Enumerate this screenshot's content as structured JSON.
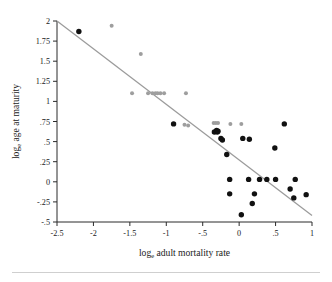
{
  "chart_data": {
    "type": "scatter",
    "title": "",
    "xlabel": "log_e adult mortality rate",
    "ylabel": "log_e age at maturity",
    "xlabel_main": "log",
    "xlabel_sub": "e",
    "xlabel_rest": " adult mortality rate",
    "ylabel_main": "log",
    "ylabel_sub": "e",
    "ylabel_rest": " age at maturity",
    "xlim": [
      -2.5,
      1.0
    ],
    "ylim": [
      -0.5,
      2.0
    ],
    "grid": false,
    "legend": "none",
    "xticks": [
      -2.5,
      -2,
      -1.5,
      -1,
      -0.5,
      0,
      0.5,
      1
    ],
    "xtick_labels": [
      "-2.5",
      "-2",
      "-1.5",
      "-1",
      "-.5",
      "0",
      ".5",
      "1"
    ],
    "yticks": [
      -0.5,
      -0.25,
      0,
      0.25,
      0.5,
      0.75,
      1,
      1.25,
      1.5,
      1.75,
      2
    ],
    "ytick_labels": [
      "-.5",
      "-.25",
      "0",
      ".25",
      ".5",
      ".75",
      "1",
      "1.25",
      "1.5",
      "1.75",
      "2"
    ],
    "colors": {
      "filled_series": "#111111",
      "open_series": "#9e9e9e",
      "fit_line": "#9b9b9b",
      "axis": "#2b2b2b"
    },
    "trend_line": {
      "label": "regression line",
      "x": [
        -2.5,
        1.0
      ],
      "y": [
        2.0,
        -0.42
      ]
    },
    "series": [
      {
        "name": "filled points",
        "marker": "filled-circle",
        "color": "#111111",
        "points": [
          [
            -2.2,
            1.87
          ],
          [
            -0.9,
            0.72
          ],
          [
            -0.34,
            0.62
          ],
          [
            -0.31,
            0.64
          ],
          [
            -0.3,
            0.62
          ],
          [
            -0.29,
            0.63
          ],
          [
            -0.25,
            0.54
          ],
          [
            -0.23,
            0.52
          ],
          [
            -0.17,
            0.34
          ],
          [
            0.05,
            0.54
          ],
          [
            0.14,
            0.53
          ],
          [
            0.62,
            0.72
          ],
          [
            0.49,
            0.42
          ],
          [
            -0.13,
            0.03
          ],
          [
            0.13,
            0.03
          ],
          [
            0.28,
            0.03
          ],
          [
            0.38,
            0.03
          ],
          [
            0.5,
            0.03
          ],
          [
            0.77,
            0.03
          ],
          [
            -0.13,
            -0.15
          ],
          [
            0.21,
            -0.15
          ],
          [
            0.7,
            -0.09
          ],
          [
            0.75,
            -0.2
          ],
          [
            0.92,
            -0.16
          ],
          [
            0.18,
            -0.27
          ],
          [
            0.03,
            -0.41
          ]
        ]
      },
      {
        "name": "open points",
        "marker": "light-circle",
        "color": "#9e9e9e",
        "points": [
          [
            -1.75,
            1.94
          ],
          [
            -1.35,
            1.59
          ],
          [
            -1.47,
            1.1
          ],
          [
            -1.25,
            1.1
          ],
          [
            -1.19,
            1.1
          ],
          [
            -1.15,
            1.1
          ],
          [
            -1.12,
            1.1
          ],
          [
            -1.08,
            1.1
          ],
          [
            -1.03,
            1.1
          ],
          [
            -0.73,
            1.1
          ],
          [
            -0.75,
            0.71
          ],
          [
            -0.7,
            0.7
          ],
          [
            -0.35,
            0.73
          ],
          [
            -0.32,
            0.73
          ],
          [
            -0.29,
            0.73
          ],
          [
            -0.12,
            0.72
          ],
          [
            0.03,
            0.72
          ]
        ]
      }
    ]
  }
}
